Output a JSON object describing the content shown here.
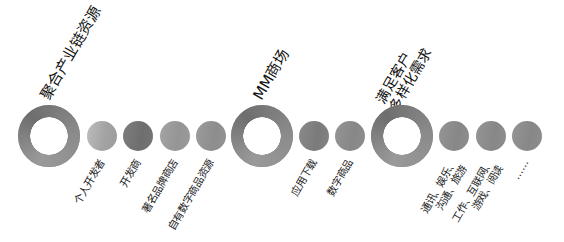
{
  "groups": [
    {
      "heading": "聚合产业链资源",
      "items": [
        "个人开发者",
        "开发商",
        "著名品牌商店",
        "自有数字商品资源"
      ]
    },
    {
      "heading": "MM商场",
      "items": [
        "应用下载",
        "数字商品"
      ]
    },
    {
      "heading": "满足客户\n多样化需求",
      "items": [
        "通讯、娱乐、\n沟通、旅游",
        "工作、互联网、\n游戏、阅读",
        "……"
      ]
    }
  ],
  "colors": {
    "ring": "#7d7d7d",
    "dot_light": "#a9a9a9",
    "dot_dark": "#747474",
    "text": "#222222",
    "background": "#ffffff"
  }
}
